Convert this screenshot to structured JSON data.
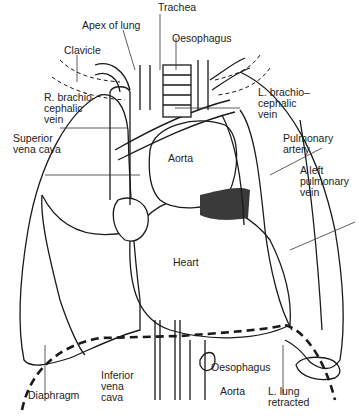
{
  "diagram": {
    "labels": {
      "trachea": "Trachea",
      "apex_of_lung": "Apex of lung",
      "oesophagus_top": "Oesophagus",
      "clavicle": "Clavicle",
      "r_brachiocephalic_vein": "R. brachio-\ncephalic\nvein",
      "l_brachiocephalic_vein": "L. brachio–\ncephalic\nvein",
      "superior_vena_cava": "Superior\nvena cava",
      "aorta_top": "Aorta",
      "pulmonary_artery": "Pulmonary\nartery",
      "left_pulmonary_vein": "A left\npulmonary\nvein",
      "heart": "Heart",
      "diaphragm": "Diaphragm",
      "inferior_vena_cava": "Inferior\nvena\ncava",
      "oesophagus_bottom": "Oesophagus",
      "aorta_bottom": "Aorta",
      "l_lung_retracted": "L. lung\nretracted"
    },
    "colors": {
      "line": "#1a1a1a",
      "fill_dark": "#3a3a3a",
      "background": "#ffffff"
    }
  }
}
